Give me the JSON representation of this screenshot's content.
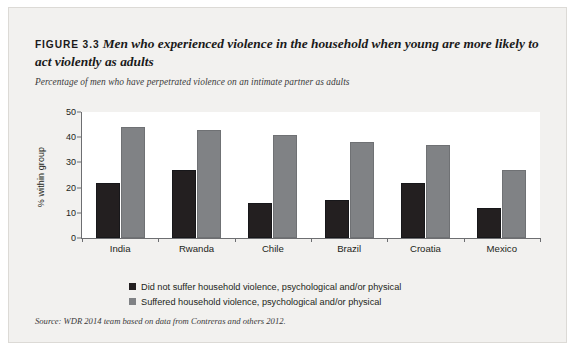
{
  "figure": {
    "label": "FIGURE 3.3",
    "title": "Men who experienced violence in the household when young are more likely to act violently as adults",
    "subtitle": "Percentage of men who have perpetrated violence on an intimate partner as adults",
    "source": "Source: WDR 2014 team based on data from Contreras and others 2012."
  },
  "colors": {
    "series_dark": "#231f20",
    "series_gray": "#808285",
    "panel_background": "#f2f1ef",
    "plot_background": "#ffffff",
    "axis": "#6d6e71"
  },
  "chart_data": {
    "type": "bar",
    "title": "Men who experienced violence in the household when young are more likely to act violently as adults",
    "subtitle": "Percentage of men who have perpetrated violence on an intimate partner as adults",
    "categories": [
      "India",
      "Rwanda",
      "Chile",
      "Brazil",
      "Croatia",
      "Mexico"
    ],
    "series": [
      {
        "name": "Did not suffer household violence, psychological and/or physical",
        "color": "#231f20",
        "values": [
          22,
          27,
          14,
          15,
          22,
          12
        ]
      },
      {
        "name": "Suffered household violence, psychological and/or physical",
        "color": "#808285",
        "values": [
          44,
          43,
          41,
          38,
          37,
          27
        ]
      }
    ],
    "xlabel": "",
    "ylabel": "% within group",
    "ylim": [
      0,
      50
    ],
    "yticks": [
      0,
      10,
      20,
      30,
      40,
      50
    ],
    "ytick_labels": [
      "0",
      "10",
      "20",
      "30",
      "40",
      "50"
    ],
    "grid": false,
    "legend_position": "bottom-center"
  }
}
